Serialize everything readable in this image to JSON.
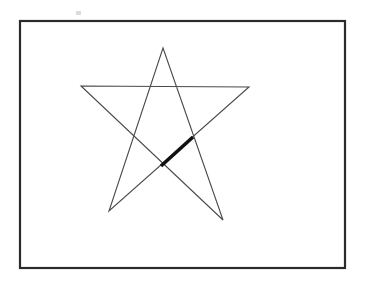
{
  "figure": {
    "title": "Unicursal five-pointed star inside a rectangular frame",
    "background_color": "#ffffff",
    "canvas": {
      "width": 366,
      "height": 283
    }
  },
  "frame": {
    "name": "rectangular border",
    "x": 20,
    "y": 21,
    "width": 325,
    "height": 247,
    "stroke_color": "#2b2b2b",
    "stroke_width": 2.2,
    "fill": "none"
  },
  "star": {
    "name": "five-pointed star",
    "point_count": 5,
    "stroke_color": "#4a4a4a",
    "stroke_width": 1.1,
    "fill": "none",
    "points": [
      {
        "label": "apex",
        "x": 163,
        "y": 48
      },
      {
        "label": "right-arm-tip",
        "x": 249,
        "y": 87
      },
      {
        "label": "left-leg-tip",
        "x": 109,
        "y": 211
      },
      {
        "label": "left-arm-tip",
        "x": 81,
        "y": 86
      },
      {
        "label": "right-leg-tip",
        "x": 223,
        "y": 220
      }
    ],
    "path_order": "apex -> right-arm-tip -> left-leg-tip -> left-arm-tip -> right-leg-tip -> apex",
    "path_d": "M 163 48 L 223 220 L 81 86 L 249 87 L 109 211 Z"
  },
  "highlight_segment": {
    "name": "thickened chord",
    "x1": 161,
    "y1": 166,
    "x2": 193,
    "y2": 137,
    "stroke_color": "#111111",
    "stroke_width": 3.6,
    "lies_on": "left-leg-tip -> right-arm-tip edge",
    "between_intersections": true
  },
  "speck": {
    "name": "faint grey speck above frame",
    "x": 76,
    "y": 11,
    "width": 5,
    "height": 4,
    "color": "#c9c9c9"
  }
}
